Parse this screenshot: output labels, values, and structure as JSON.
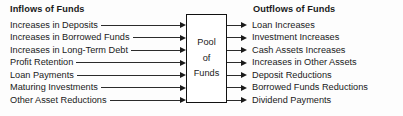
{
  "diagram": {
    "title_left": "Inflows of Funds",
    "title_right": "Outflows of Funds",
    "center_box": {
      "line1": "Pool",
      "line2": "of",
      "line3": "Funds"
    },
    "inflows": [
      {
        "label": "Increases in Deposits"
      },
      {
        "label": "Increases in Borrowed Funds"
      },
      {
        "label": "Increases in Long-Term Debt"
      },
      {
        "label": "Profit Retention"
      },
      {
        "label": "Loan Payments"
      },
      {
        "label": "Maturing Investments"
      },
      {
        "label": "Other Asset Reductions"
      }
    ],
    "outflows": [
      {
        "label": "Loan Increases"
      },
      {
        "label": "Investment Increases"
      },
      {
        "label": "Cash Assets Increases"
      },
      {
        "label": "Increases in Other Assets"
      },
      {
        "label": "Deposit Reductions"
      },
      {
        "label": "Borrowed Funds Reductions"
      },
      {
        "label": "Dividend Payments"
      }
    ],
    "colors": {
      "background": "#fdfdfd",
      "text": "#1a1a1a",
      "line": "#2b2b2b",
      "box_border": "#111111"
    }
  }
}
